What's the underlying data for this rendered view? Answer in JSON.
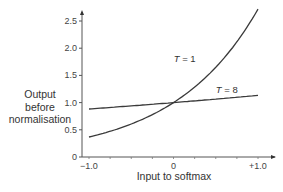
{
  "chart_data": {
    "type": "line",
    "title": "",
    "xlabel": "Input to softmax",
    "ylabel": "Output before normalisation",
    "ylabel_lines": [
      "Output",
      "before",
      "normalisation"
    ],
    "xlim": [
      -1.0,
      1.0
    ],
    "ylim": [
      0,
      2.7
    ],
    "x_ticks": [
      -1.0,
      -0.75,
      -0.5,
      -0.25,
      0,
      0.25,
      0.5,
      0.75,
      1.0
    ],
    "x_tick_labels": [
      {
        "value": -1.0,
        "label": "−1.0"
      },
      {
        "value": 0,
        "label": "0"
      },
      {
        "value": 1.0,
        "label": "+1.0"
      }
    ],
    "y_tick_labels": [
      {
        "value": 0,
        "label": "0"
      },
      {
        "value": 0.5,
        "label": "0.5"
      },
      {
        "value": 1.0,
        "label": "1.0"
      },
      {
        "value": 1.5,
        "label": "1.5"
      },
      {
        "value": 2.0,
        "label": "2.0"
      },
      {
        "value": 2.5,
        "label": "2.5"
      }
    ],
    "grid": false,
    "legend": "none (inline curve labels)",
    "series": [
      {
        "name": "T = 1",
        "label_position": {
          "x": 0.05,
          "y": 1.75
        },
        "x": [
          -1.0,
          -0.75,
          -0.5,
          -0.25,
          0,
          0.25,
          0.5,
          0.75,
          1.0
        ],
        "values": [
          0.37,
          0.47,
          0.61,
          0.78,
          1.0,
          1.28,
          1.65,
          2.12,
          2.72
        ]
      },
      {
        "name": "T = 8",
        "label_position": {
          "x": 0.5,
          "y": 1.18
        },
        "x": [
          -1.0,
          -0.5,
          0,
          0.5,
          1.0
        ],
        "values": [
          0.88,
          0.94,
          1.0,
          1.06,
          1.13
        ]
      }
    ],
    "color": "#333333"
  }
}
